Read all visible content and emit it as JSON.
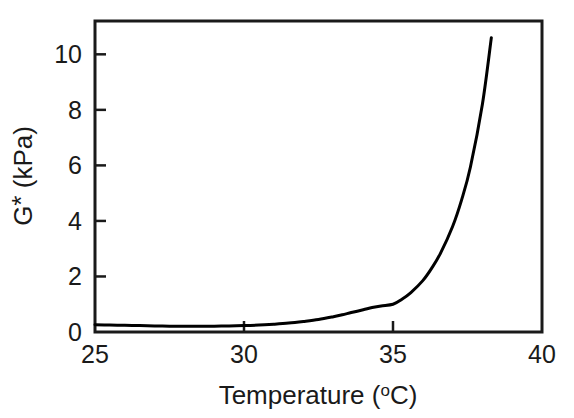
{
  "chart_data": {
    "type": "line",
    "title": "",
    "subtitle": "",
    "xlabel": "Temperature (°C)",
    "ylabel": "G* (kPa)",
    "ylabel_parts": {
      "symbol": "G",
      "star": "*",
      "unit": "(kPa)"
    },
    "xlabel_parts": {
      "name": "Temperature",
      "degree": "o",
      "unit_open": "(",
      "unit_letter": "C",
      "unit_close": ")"
    },
    "xlim": [
      25,
      40
    ],
    "ylim": [
      0,
      11.2
    ],
    "xticks": [
      25,
      30,
      35,
      40
    ],
    "xtick_labels": [
      "25",
      "30",
      "35",
      "40"
    ],
    "yticks": [
      0,
      2,
      4,
      6,
      8,
      10
    ],
    "ytick_labels": [
      "0",
      "2",
      "4",
      "6",
      "8",
      "10"
    ],
    "grid": false,
    "legend": "none",
    "tick_direction": "in",
    "frame": "box",
    "line_color": "#000000",
    "line_width": 3,
    "background_color": "#ffffff",
    "series": [
      {
        "name": "G*",
        "x": [
          25.0,
          25.5,
          26.0,
          26.5,
          27.0,
          27.5,
          28.0,
          28.5,
          29.0,
          29.5,
          30.0,
          30.5,
          31.0,
          31.5,
          32.0,
          32.5,
          33.0,
          33.3,
          33.6,
          34.0,
          34.3,
          34.6,
          35.0,
          35.3,
          35.6,
          36.0,
          36.3,
          36.6,
          37.0,
          37.3,
          37.6,
          38.0,
          38.3
        ],
        "y": [
          0.26,
          0.25,
          0.24,
          0.23,
          0.22,
          0.21,
          0.21,
          0.21,
          0.21,
          0.22,
          0.23,
          0.25,
          0.28,
          0.32,
          0.38,
          0.45,
          0.55,
          0.62,
          0.7,
          0.8,
          0.88,
          0.94,
          1.0,
          1.18,
          1.42,
          1.85,
          2.3,
          2.85,
          3.8,
          4.75,
          5.95,
          8.2,
          10.6
        ]
      }
    ],
    "annotations": []
  },
  "figure": {
    "name": "g-star-vs-temperature-plot",
    "width_px": 574,
    "height_px": 418
  }
}
